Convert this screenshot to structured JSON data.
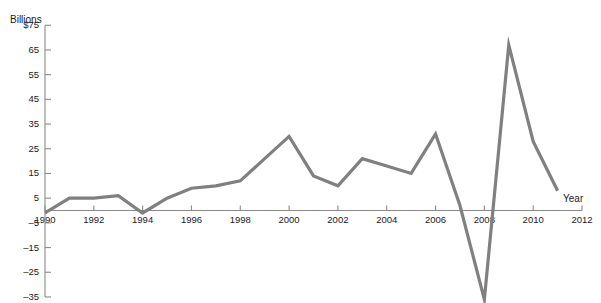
{
  "top_caption": "",
  "chart_data": {
    "type": "line",
    "title": "",
    "xlabel": "Year",
    "ylabel": "Billions",
    "ylabel_unit_prefix": "$",
    "grid": false,
    "legend": "none",
    "line_color": "#808080",
    "axis_color": "#8a8a8a",
    "text_color": "#1a1a1a",
    "xlim": [
      1990,
      2012
    ],
    "ylim": [
      -40,
      75
    ],
    "yticks": [
      75,
      65,
      55,
      45,
      35,
      25,
      15,
      5,
      -5,
      -15,
      -25,
      -35
    ],
    "ytick_labels": [
      "$75",
      "65",
      "55",
      "45",
      "35",
      "25",
      "15",
      "5",
      "–5",
      "–15",
      "–25",
      "–35"
    ],
    "xticks": [
      1990,
      1992,
      1994,
      1996,
      1998,
      2000,
      2002,
      2004,
      2006,
      2008,
      2010,
      2012
    ],
    "xtick_labels": [
      "1990",
      "1992",
      "1994",
      "1996",
      "1998",
      "2000",
      "2002",
      "2004",
      "2006",
      "2008",
      "2010",
      "2012"
    ],
    "x": [
      1990,
      1991,
      1992,
      1993,
      1994,
      1995,
      1996,
      1997,
      1998,
      1999,
      2000,
      2001,
      2002,
      2003,
      2004,
      2005,
      2006,
      2007,
      2008,
      2009,
      2010,
      2011
    ],
    "values": [
      -1,
      5,
      5,
      6,
      -1,
      5,
      9,
      10,
      12,
      21,
      30,
      14,
      10,
      21,
      18,
      15,
      31,
      2,
      -36,
      67,
      28,
      8
    ],
    "series": [
      {
        "name": "Billions",
        "values": [
          -1,
          5,
          5,
          6,
          -1,
          5,
          9,
          10,
          12,
          21,
          30,
          14,
          10,
          21,
          18,
          15,
          31,
          2,
          -36,
          67,
          28,
          8
        ]
      }
    ]
  }
}
